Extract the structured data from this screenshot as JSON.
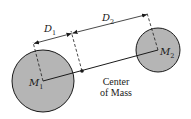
{
  "diagram": {
    "colors": {
      "mass_fill": "#b5b5b5",
      "stroke": "#1a1a1a",
      "background": "#ffffff"
    },
    "masses": [
      {
        "id": "m1",
        "label_main": "M",
        "label_sub": "1",
        "cx": 43,
        "cy": 81,
        "r": 31
      },
      {
        "id": "m2",
        "label_main": "M",
        "label_sub": "2",
        "cx": 158,
        "cy": 50,
        "r": 22
      }
    ],
    "center_of_mass": {
      "x": 82,
      "y": 71,
      "label_line1": "Center",
      "label_line2": "of Mass"
    },
    "dimensions": [
      {
        "id": "d1",
        "label_main": "D",
        "label_sub": "1"
      },
      {
        "id": "d2",
        "label_main": "D",
        "label_sub": "2"
      }
    ]
  }
}
